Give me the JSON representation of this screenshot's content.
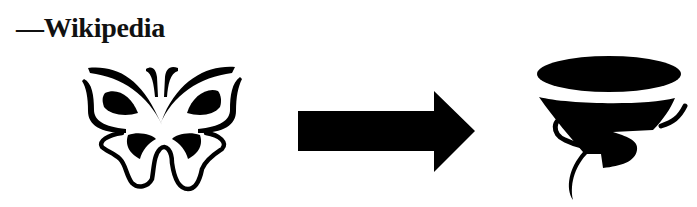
{
  "caption": {
    "text": "—Wikipedia"
  },
  "diagram": {
    "source_icon": "butterfly-icon",
    "connector": "right-arrow",
    "target_icon": "tornado-icon",
    "ink_color": "#000000",
    "background_color": "#ffffff"
  }
}
